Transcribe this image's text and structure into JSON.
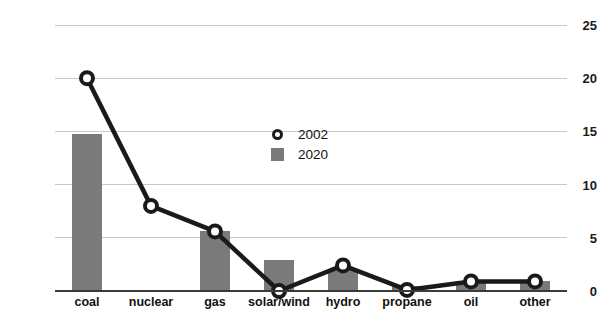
{
  "chart_data": {
    "type": "bar",
    "title": "",
    "subtitle": "",
    "xlabel": "",
    "ylabel": "",
    "categories": [
      "coal",
      "nuclear",
      "gas",
      "solar/wind",
      "hydro",
      "propane",
      "oil",
      "other"
    ],
    "series": [
      {
        "name": "2002",
        "type": "line",
        "marker": "circle-open",
        "color": "#1a1a1a",
        "values": [
          20.0,
          8.0,
          5.6,
          0.0,
          2.4,
          0.1,
          0.9,
          0.9
        ]
      },
      {
        "name": "2020",
        "type": "bar",
        "color": "#7a7a7a",
        "values": [
          14.8,
          0.0,
          5.6,
          2.9,
          2.1,
          0.5,
          0.9,
          0.9
        ]
      }
    ],
    "ylim": [
      0,
      25
    ],
    "yticks": [
      0,
      5,
      10,
      15,
      20,
      25
    ],
    "ytick_labels": [
      "0",
      "5",
      "10",
      "15",
      "20",
      "25"
    ],
    "grid": true,
    "grid_axis": "y",
    "legend_position": "center",
    "legend_entries": [
      "2002",
      "2020"
    ],
    "axis_color": "#3b3b3b",
    "grid_color": "#c8c8c8",
    "background": "#ffffff"
  }
}
